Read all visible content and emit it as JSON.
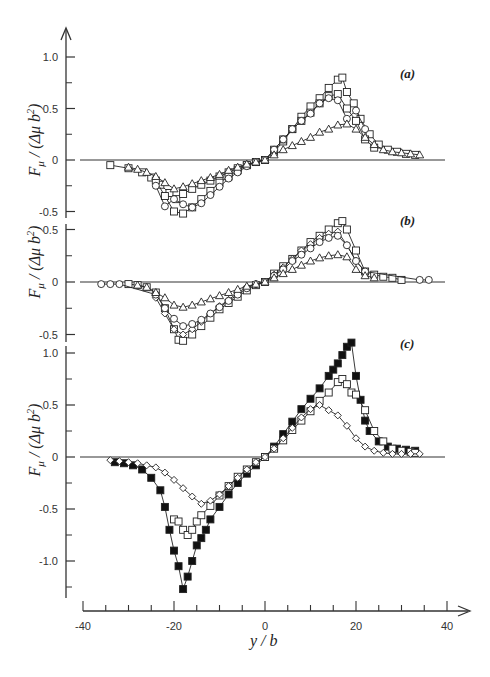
{
  "chart_data": {
    "type": "line",
    "title": "",
    "xlabel": "y / b",
    "ylabel": "F_μ / (Δμ b²)",
    "x_axis": {
      "range": [
        -40,
        40
      ],
      "major_ticks": [
        -40,
        -20,
        0,
        20,
        40
      ],
      "minor_step": 5
    },
    "legend": "none (markers only)",
    "panels": [
      {
        "label": "(a)",
        "ylim": [
          -0.6,
          1.1
        ],
        "y_ticks": [
          1.0,
          0.5,
          0,
          -0.5
        ],
        "y_tick_labels": [
          "1.0",
          "0.5",
          "0",
          "-0.5"
        ],
        "series": [
          {
            "name": "squares (large)",
            "marker": "square",
            "filled": false,
            "x": [
              -34,
              -30,
              -27,
              -25,
              -23,
              -21,
              -19.5,
              -18,
              -16,
              -14,
              -12,
              -10,
              -8,
              -6,
              -4,
              -2,
              0,
              2,
              4,
              6,
              8,
              10,
              12,
              14,
              16,
              17,
              18,
              19.5,
              21,
              23,
              25,
              27,
              29,
              31,
              33
            ],
            "y": [
              -0.05,
              -0.08,
              -0.12,
              -0.17,
              -0.24,
              -0.32,
              -0.38,
              -0.33,
              -0.28,
              -0.24,
              -0.2,
              -0.16,
              -0.12,
              -0.08,
              -0.05,
              -0.02,
              0.0,
              0.08,
              0.18,
              0.3,
              0.42,
              0.52,
              0.6,
              0.7,
              0.78,
              0.8,
              0.66,
              0.55,
              0.4,
              0.25,
              0.15,
              0.1,
              0.08,
              0.06,
              0.05
            ]
          },
          {
            "name": "squares (medium)",
            "marker": "square",
            "filled": false,
            "x": [
              -24,
              -22,
              -20,
              -18,
              -16,
              -14,
              -12,
              -10,
              -8,
              -6,
              -4,
              -2,
              0,
              2,
              4,
              6,
              8,
              10,
              12,
              14,
              16,
              18,
              20,
              22,
              24
            ],
            "y": [
              -0.2,
              -0.35,
              -0.5,
              -0.52,
              -0.46,
              -0.38,
              -0.3,
              -0.22,
              -0.16,
              -0.1,
              -0.05,
              -0.02,
              0.0,
              0.1,
              0.2,
              0.3,
              0.38,
              0.46,
              0.55,
              0.62,
              0.64,
              0.5,
              0.38,
              0.2,
              0.12
            ]
          },
          {
            "name": "circles",
            "marker": "circle",
            "filled": false,
            "x": [
              -24,
              -22,
              -20,
              -18,
              -16,
              -14,
              -12,
              -10,
              -8,
              -6,
              -4,
              -2,
              0,
              2,
              4,
              6,
              8,
              10,
              12,
              14,
              16,
              18,
              20,
              22
            ],
            "y": [
              -0.25,
              -0.45,
              -0.38,
              -0.43,
              -0.46,
              -0.42,
              -0.34,
              -0.26,
              -0.18,
              -0.12,
              -0.06,
              -0.02,
              0.0,
              0.1,
              0.2,
              0.3,
              0.38,
              0.45,
              0.55,
              0.6,
              0.58,
              0.4,
              0.48,
              0.3
            ]
          },
          {
            "name": "triangles",
            "marker": "triangle",
            "filled": false,
            "x": [
              -30,
              -28,
              -26,
              -24,
              -22,
              -20,
              -18,
              -16,
              -14,
              -12,
              -10,
              -8,
              -6,
              -4,
              -2,
              0,
              2,
              4,
              6,
              8,
              10,
              12,
              14,
              16,
              18,
              20,
              22,
              24,
              26,
              28,
              30,
              32,
              34
            ],
            "y": [
              -0.07,
              -0.09,
              -0.12,
              -0.16,
              -0.22,
              -0.28,
              -0.26,
              -0.23,
              -0.2,
              -0.17,
              -0.14,
              -0.1,
              -0.07,
              -0.04,
              -0.02,
              0.0,
              0.05,
              0.1,
              0.14,
              0.18,
              0.22,
              0.27,
              0.3,
              0.34,
              0.35,
              0.3,
              0.22,
              0.15,
              0.1,
              0.08,
              0.07,
              0.06,
              0.05
            ]
          }
        ]
      },
      {
        "label": "(b)",
        "ylim": [
          -0.6,
          0.6
        ],
        "y_ticks": [
          0.5,
          0,
          -0.5
        ],
        "y_tick_labels": [
          "0.5",
          "0",
          "-0.5"
        ],
        "series": [
          {
            "name": "squares",
            "marker": "square",
            "filled": false,
            "x": [
              -30,
              -28,
              -26,
              -24,
              -22,
              -20,
              -19,
              -18,
              -16,
              -14,
              -12,
              -10,
              -8,
              -6,
              -4,
              -2,
              0,
              2,
              4,
              6,
              8,
              10,
              12,
              14,
              16,
              17,
              18,
              20,
              22,
              24,
              26,
              28,
              30
            ],
            "y": [
              -0.02,
              -0.03,
              -0.05,
              -0.1,
              -0.25,
              -0.45,
              -0.55,
              -0.56,
              -0.5,
              -0.42,
              -0.34,
              -0.26,
              -0.2,
              -0.14,
              -0.08,
              -0.03,
              0.0,
              0.08,
              0.15,
              0.22,
              0.3,
              0.38,
              0.44,
              0.5,
              0.56,
              0.58,
              0.5,
              0.3,
              0.1,
              0.07,
              0.05,
              0.04,
              0.02
            ]
          },
          {
            "name": "diamonds",
            "marker": "diamond",
            "filled": false,
            "x": [
              -24,
              -22,
              -20,
              -18,
              -16,
              -14,
              -12,
              -10,
              -8,
              -6,
              -4,
              -2,
              0,
              2,
              4,
              6,
              8,
              10,
              12,
              14,
              16,
              18,
              20,
              22
            ],
            "y": [
              -0.15,
              -0.3,
              -0.45,
              -0.5,
              -0.45,
              -0.38,
              -0.3,
              -0.23,
              -0.17,
              -0.1,
              -0.05,
              -0.02,
              0.0,
              0.07,
              0.14,
              0.22,
              0.3,
              0.36,
              0.42,
              0.46,
              0.48,
              0.35,
              0.2,
              0.1
            ]
          },
          {
            "name": "circles",
            "marker": "circle",
            "filled": false,
            "x": [
              -36,
              -34,
              -32,
              -24,
              -22,
              -20,
              -18,
              -16,
              -14,
              -12,
              -10,
              -8,
              -6,
              -4,
              -2,
              0,
              2,
              4,
              6,
              8,
              10,
              12,
              14,
              16,
              18,
              20,
              22,
              34,
              36
            ],
            "y": [
              -0.02,
              -0.02,
              -0.02,
              -0.12,
              -0.25,
              -0.35,
              -0.42,
              -0.4,
              -0.36,
              -0.3,
              -0.24,
              -0.18,
              -0.12,
              -0.06,
              -0.02,
              0.0,
              0.06,
              0.12,
              0.2,
              0.26,
              0.32,
              0.38,
              0.42,
              0.44,
              0.35,
              0.2,
              0.1,
              0.02,
              0.02
            ]
          },
          {
            "name": "triangles",
            "marker": "triangle",
            "filled": false,
            "x": [
              -28,
              -26,
              -24,
              -22,
              -20,
              -18,
              -16,
              -14,
              -12,
              -10,
              -8,
              -6,
              -4,
              -2,
              0,
              2,
              4,
              6,
              8,
              10,
              12,
              14,
              16,
              18,
              20,
              22,
              24
            ],
            "y": [
              -0.03,
              -0.05,
              -0.1,
              -0.15,
              -0.22,
              -0.24,
              -0.22,
              -0.19,
              -0.16,
              -0.13,
              -0.1,
              -0.07,
              -0.04,
              -0.02,
              0.0,
              0.04,
              0.08,
              0.12,
              0.16,
              0.2,
              0.23,
              0.25,
              0.26,
              0.24,
              0.12,
              0.06,
              0.04
            ]
          }
        ]
      },
      {
        "label": "(c)",
        "ylim": [
          -1.35,
          1.1
        ],
        "y_ticks": [
          1.0,
          0.5,
          0,
          -0.5,
          -1.0
        ],
        "y_tick_labels": [
          "1.0",
          "0.5",
          "0",
          "-0.5",
          "-1.0"
        ],
        "series": [
          {
            "name": "filled squares",
            "marker": "square",
            "filled": true,
            "x": [
              -33,
              -31,
              -29,
              -27,
              -25,
              -23,
              -22,
              -21,
              -20,
              -19,
              -18,
              -17,
              -16,
              -15,
              -14,
              -13,
              -12,
              -10,
              -8,
              -6,
              -4,
              -2,
              0,
              2,
              4,
              6,
              8,
              10,
              12,
              14,
              15,
              16,
              17,
              18,
              19,
              20,
              21,
              22,
              23,
              25,
              27,
              29,
              31,
              33
            ],
            "y": [
              -0.05,
              -0.06,
              -0.08,
              -0.12,
              -0.2,
              -0.32,
              -0.48,
              -0.7,
              -0.9,
              -1.05,
              -1.27,
              -1.15,
              -1.0,
              -0.85,
              -0.78,
              -0.7,
              -0.6,
              -0.48,
              -0.36,
              -0.25,
              -0.16,
              -0.08,
              0.0,
              0.1,
              0.22,
              0.34,
              0.46,
              0.56,
              0.66,
              0.78,
              0.84,
              0.9,
              0.98,
              1.06,
              1.1,
              0.78,
              0.55,
              0.35,
              0.25,
              0.15,
              0.1,
              0.08,
              0.07,
              0.06
            ]
          },
          {
            "name": "open squares",
            "marker": "square",
            "filled": false,
            "x": [
              -20,
              -19,
              -18,
              -17,
              -16,
              -15,
              -14,
              -12,
              -10,
              -8,
              -6,
              -4,
              -2,
              0,
              2,
              4,
              6,
              8,
              10,
              12,
              14,
              16,
              17,
              18,
              19,
              20,
              22,
              24,
              26,
              28,
              30,
              32,
              33
            ],
            "y": [
              -0.6,
              -0.62,
              -0.7,
              -0.75,
              -0.7,
              -0.62,
              -0.56,
              -0.47,
              -0.37,
              -0.28,
              -0.19,
              -0.12,
              -0.05,
              0.0,
              0.08,
              0.16,
              0.26,
              0.35,
              0.44,
              0.54,
              0.62,
              0.72,
              0.75,
              0.7,
              0.62,
              0.6,
              0.45,
              0.25,
              0.15,
              0.08,
              0.06,
              0.05,
              0.04
            ]
          },
          {
            "name": "small diamonds",
            "marker": "diamond",
            "filled": false,
            "x": [
              -34,
              -32,
              -30,
              -28,
              -26,
              -24,
              -22,
              -20,
              -18,
              -16,
              -14,
              -12,
              -10,
              -8,
              -6,
              -4,
              -2,
              0,
              2,
              4,
              6,
              8,
              10,
              12,
              14,
              16,
              18,
              20,
              22,
              24,
              26,
              28,
              30,
              32,
              34
            ],
            "y": [
              -0.03,
              -0.04,
              -0.05,
              -0.06,
              -0.08,
              -0.1,
              -0.15,
              -0.22,
              -0.3,
              -0.38,
              -0.45,
              -0.42,
              -0.36,
              -0.28,
              -0.2,
              -0.12,
              -0.05,
              0.0,
              0.08,
              0.18,
              0.28,
              0.38,
              0.46,
              0.5,
              0.45,
              0.4,
              0.3,
              0.18,
              0.1,
              0.06,
              0.04,
              0.03,
              0.03,
              0.03,
              0.03
            ]
          }
        ]
      }
    ]
  },
  "labels": {
    "panel_a": "(a)",
    "panel_b": "(b)",
    "panel_c": "(c)",
    "xlabel": "y / b",
    "ylabel_F": "F",
    "ylabel_sub": "μ",
    "ylabel_rest": " / (Δμ b",
    "ylabel_sup": "2",
    "ylabel_close": ")",
    "x_ticks": [
      "-40",
      "-20",
      "0",
      "20",
      "40"
    ]
  }
}
